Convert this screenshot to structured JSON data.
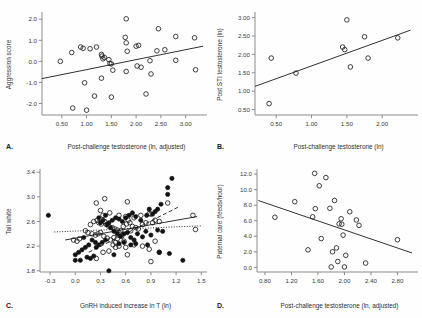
{
  "figure": {
    "name": "four-panel-scatter-figure",
    "panel_letters": {
      "a": "A.",
      "b": "B.",
      "c": "C.",
      "d": "D."
    }
  },
  "chart_data": [
    {
      "id": "a",
      "type": "scatter",
      "title": "",
      "xlabel": "Post-challenge testosterone (ln, adjusted)",
      "ylabel": "Aggression score",
      "xlim": [
        0.1,
        3.35
      ],
      "ylim": [
        -2.55,
        2.25
      ],
      "xticks": [
        0.5,
        1.0,
        1.5,
        2.0,
        2.5,
        3.0
      ],
      "xticklabels": [
        "0.50",
        "1.00",
        "1.50",
        "2.00",
        "2.50",
        "3.00"
      ],
      "yticks": [
        -2.0,
        -1.0,
        0.0,
        1.0,
        2.0
      ],
      "yticklabels": [
        "-2.0",
        "-1.0",
        "0.0",
        "1.0",
        "2.0"
      ],
      "grid": false,
      "legend": "none",
      "marker": "open-circle",
      "points": [
        [
          0.47,
          0.0
        ],
        [
          0.7,
          0.42
        ],
        [
          0.72,
          -2.22
        ],
        [
          0.88,
          0.68
        ],
        [
          0.93,
          0.62
        ],
        [
          0.96,
          -1.02
        ],
        [
          1.0,
          -2.32
        ],
        [
          1.07,
          0.6
        ],
        [
          1.2,
          0.68
        ],
        [
          1.16,
          -1.65
        ],
        [
          1.3,
          0.33
        ],
        [
          1.31,
          0.25
        ],
        [
          1.33,
          0.12
        ],
        [
          1.36,
          0.18
        ],
        [
          1.3,
          -0.8
        ],
        [
          1.45,
          0.08
        ],
        [
          1.47,
          -0.1
        ],
        [
          1.5,
          -0.12
        ],
        [
          1.5,
          -1.7
        ],
        [
          1.53,
          -0.42
        ],
        [
          1.8,
          2.02
        ],
        [
          1.78,
          1.14
        ],
        [
          1.8,
          0.88
        ],
        [
          1.82,
          0.48
        ],
        [
          1.8,
          -0.48
        ],
        [
          2.0,
          0.72
        ],
        [
          2.05,
          0.76
        ],
        [
          2.02,
          -0.22
        ],
        [
          2.1,
          -0.28
        ],
        [
          2.2,
          -1.55
        ],
        [
          2.28,
          0.03
        ],
        [
          2.3,
          -0.6
        ],
        [
          2.42,
          0.5
        ],
        [
          2.45,
          1.55
        ],
        [
          2.58,
          0.55
        ],
        [
          2.8,
          1.18
        ],
        [
          2.8,
          0.05
        ],
        [
          3.18,
          1.12
        ],
        [
          3.2,
          -0.4
        ]
      ],
      "fit_lines": [
        {
          "style": "solid",
          "x0": 0.1,
          "y0": -0.82,
          "x1": 3.35,
          "y1": 0.72
        }
      ]
    },
    {
      "id": "b",
      "type": "scatter",
      "title": "",
      "xlabel": "Post-challenge testosterone (ln)",
      "ylabel": "Post STI testosterone (ln)",
      "xlim": [
        0.2,
        2.45
      ],
      "ylim": [
        0.35,
        3.1
      ],
      "xticks": [
        0.5,
        1.0,
        1.5,
        2.0
      ],
      "xticklabels": [
        "0.50",
        "1.00",
        "1.50",
        "2.00"
      ],
      "yticks": [
        0.5,
        1.0,
        1.5,
        2.0,
        2.5,
        3.0
      ],
      "yticklabels": [
        "0.50",
        "1.00",
        "1.50",
        "2.00",
        "2.50",
        "3.00"
      ],
      "grid": false,
      "legend": "none",
      "marker": "open-circle",
      "points": [
        [
          0.4,
          0.66
        ],
        [
          0.43,
          1.9
        ],
        [
          0.78,
          1.49
        ],
        [
          1.44,
          2.2
        ],
        [
          1.47,
          2.13
        ],
        [
          1.5,
          2.94
        ],
        [
          1.55,
          1.66
        ],
        [
          1.75,
          2.48
        ],
        [
          1.8,
          1.9
        ],
        [
          2.22,
          2.45
        ]
      ],
      "fit_lines": [
        {
          "style": "solid",
          "x0": 0.2,
          "y0": 1.13,
          "x1": 2.4,
          "y1": 2.66
        }
      ]
    },
    {
      "id": "c",
      "type": "scatter",
      "title": "",
      "xlabel": "GnRH induced increase in T (ln)",
      "ylabel": "Tail white",
      "xlim": [
        -0.42,
        1.52
      ],
      "ylim": [
        1.78,
        3.42
      ],
      "xticks": [
        -0.3,
        0.0,
        0.3,
        0.6,
        0.9,
        1.2,
        1.5
      ],
      "xticklabels": [
        "-0.3",
        "0.0",
        "0.3",
        "0.6",
        "0.9",
        "1.2",
        "1.5"
      ],
      "yticks": [
        1.8,
        2.2,
        2.6,
        3.0,
        3.4
      ],
      "yticklabels": [
        "1.8",
        "2.2",
        "2.6",
        "3.0",
        "3.4"
      ],
      "grid": false,
      "legend": "none",
      "marker": "mixed-open-and-filled",
      "points_open": [
        [
          0.25,
          2.9
        ],
        [
          0.35,
          2.97
        ],
        [
          0.62,
          2.92
        ],
        [
          0.3,
          2.78
        ],
        [
          0.33,
          2.7
        ],
        [
          0.41,
          2.74
        ],
        [
          0.52,
          2.7
        ],
        [
          0.6,
          2.68
        ],
        [
          0.63,
          2.62
        ],
        [
          0.7,
          2.66
        ],
        [
          0.78,
          2.7
        ],
        [
          0.88,
          2.73
        ],
        [
          0.9,
          2.72
        ],
        [
          0.95,
          2.62
        ],
        [
          1.0,
          2.6
        ],
        [
          1.1,
          2.9
        ],
        [
          1.4,
          2.7
        ],
        [
          1.43,
          2.47
        ],
        [
          0.18,
          2.55
        ],
        [
          0.22,
          2.6
        ],
        [
          0.26,
          2.62
        ],
        [
          0.28,
          2.58
        ],
        [
          0.31,
          2.56
        ],
        [
          0.35,
          2.6
        ],
        [
          0.37,
          2.55
        ],
        [
          0.4,
          2.52
        ],
        [
          0.44,
          2.5
        ],
        [
          0.47,
          2.48
        ],
        [
          0.5,
          2.46
        ],
        [
          0.54,
          2.45
        ],
        [
          0.57,
          2.52
        ],
        [
          0.61,
          2.56
        ],
        [
          0.65,
          2.58
        ],
        [
          0.68,
          2.52
        ],
        [
          0.72,
          2.5
        ],
        [
          0.8,
          2.55
        ],
        [
          0.84,
          2.58
        ],
        [
          0.92,
          2.58
        ],
        [
          0.12,
          2.45
        ],
        [
          0.15,
          2.42
        ],
        [
          0.2,
          2.4
        ],
        [
          0.24,
          2.38
        ],
        [
          0.27,
          2.4
        ],
        [
          0.3,
          2.42
        ],
        [
          0.34,
          2.36
        ],
        [
          0.38,
          2.33
        ],
        [
          0.42,
          2.3
        ],
        [
          0.46,
          2.34
        ],
        [
          0.5,
          2.32
        ],
        [
          0.55,
          2.36
        ],
        [
          0.58,
          2.28
        ],
        [
          0.05,
          2.32
        ],
        [
          -0.02,
          2.3
        ],
        [
          0.02,
          2.28
        ],
        [
          0.45,
          2.22
        ],
        [
          0.48,
          2.18
        ],
        [
          0.52,
          2.2
        ],
        [
          0.4,
          2.12
        ],
        [
          0.33,
          2.1
        ],
        [
          0.25,
          2.0
        ],
        [
          0.6,
          2.18
        ],
        [
          0.7,
          2.22
        ],
        [
          0.8,
          2.2
        ],
        [
          0.62,
          2.06
        ],
        [
          0.88,
          2.15
        ],
        [
          0.9,
          1.95
        ],
        [
          1.0,
          2.1
        ],
        [
          0.95,
          2.28
        ],
        [
          0.48,
          2.26
        ],
        [
          0.52,
          2.42
        ],
        [
          0.66,
          2.45
        ],
        [
          0.75,
          2.48
        ]
      ],
      "points_filled": [
        [
          -0.32,
          2.7
        ],
        [
          1.15,
          3.3
        ],
        [
          1.1,
          3.15
        ],
        [
          1.1,
          3.04
        ],
        [
          1.02,
          2.88
        ],
        [
          0.98,
          2.8
        ],
        [
          0.95,
          2.76
        ],
        [
          0.92,
          2.72
        ],
        [
          0.88,
          2.8
        ],
        [
          0.85,
          2.7
        ],
        [
          0.78,
          2.62
        ],
        [
          0.72,
          2.68
        ],
        [
          0.68,
          2.74
        ],
        [
          0.64,
          2.7
        ],
        [
          0.6,
          2.66
        ],
        [
          0.56,
          2.6
        ],
        [
          0.52,
          2.64
        ],
        [
          0.48,
          2.66
        ],
        [
          0.44,
          2.62
        ],
        [
          0.4,
          2.58
        ],
        [
          0.36,
          2.7
        ],
        [
          0.33,
          2.62
        ],
        [
          0.3,
          2.58
        ],
        [
          0.28,
          2.66
        ],
        [
          0.38,
          2.55
        ],
        [
          0.42,
          2.5
        ],
        [
          0.46,
          2.44
        ],
        [
          0.5,
          2.4
        ],
        [
          0.54,
          2.36
        ],
        [
          0.58,
          2.4
        ],
        [
          0.62,
          2.42
        ],
        [
          0.66,
          2.34
        ],
        [
          0.7,
          2.3
        ],
        [
          0.74,
          2.4
        ],
        [
          0.8,
          2.35
        ],
        [
          0.84,
          2.44
        ],
        [
          0.9,
          2.38
        ],
        [
          0.98,
          2.46
        ],
        [
          0.36,
          2.3
        ],
        [
          0.32,
          2.26
        ],
        [
          0.28,
          2.22
        ],
        [
          0.24,
          2.26
        ],
        [
          0.2,
          2.3
        ],
        [
          0.16,
          2.22
        ],
        [
          0.12,
          2.18
        ],
        [
          0.08,
          2.14
        ],
        [
          0.04,
          2.1
        ],
        [
          0.0,
          2.06
        ],
        [
          0.14,
          2.02
        ],
        [
          0.18,
          2.0
        ],
        [
          0.22,
          2.04
        ],
        [
          0.06,
          1.97
        ],
        [
          0.0,
          1.97
        ],
        [
          0.4,
          1.8
        ],
        [
          0.46,
          2.06
        ],
        [
          0.52,
          2.24
        ],
        [
          0.58,
          2.26
        ],
        [
          0.66,
          2.22
        ],
        [
          0.72,
          2.24
        ],
        [
          0.86,
          2.22
        ],
        [
          1.0,
          2.1
        ],
        [
          1.04,
          2.44
        ],
        [
          1.12,
          2.08
        ],
        [
          1.28,
          1.97
        ],
        [
          0.1,
          2.34
        ],
        [
          0.25,
          2.18
        ]
      ],
      "fit_lines": [
        {
          "style": "solid",
          "x0": -0.12,
          "y0": 2.3,
          "x1": 1.45,
          "y1": 2.68
        },
        {
          "style": "dashed",
          "x0": 0.16,
          "y0": 2.1,
          "x1": 1.22,
          "y1": 2.83
        },
        {
          "style": "dotted",
          "x0": -0.25,
          "y0": 2.43,
          "x1": 1.5,
          "y1": 2.53
        }
      ]
    },
    {
      "id": "d",
      "type": "scatter",
      "title": "",
      "xlabel": "Post-challenge testosterone (ln, adjusted)",
      "ylabel": "Paternal care (feeds/hour)",
      "xlim": [
        0.68,
        3.05
      ],
      "ylim": [
        -0.6,
        12.4
      ],
      "xticks": [
        0.8,
        1.2,
        1.6,
        2.0,
        2.4,
        2.8
      ],
      "xticklabels": [
        "0.80",
        "1.20",
        "1.60",
        "2.00",
        "2.40",
        "2.80"
      ],
      "yticks": [
        0.0,
        2.0,
        4.0,
        6.0,
        8.0,
        10.0,
        12.0
      ],
      "yticklabels": [
        "0.0",
        "2.0",
        "4.0",
        "6.0",
        "8.0",
        "10.0",
        "12.0"
      ],
      "grid": false,
      "legend": "none",
      "marker": "open-circle",
      "points": [
        [
          0.95,
          6.45
        ],
        [
          1.25,
          8.45
        ],
        [
          1.45,
          2.25
        ],
        [
          1.52,
          6.5
        ],
        [
          1.55,
          12.1
        ],
        [
          1.56,
          7.55
        ],
        [
          1.62,
          10.5
        ],
        [
          1.65,
          3.7
        ],
        [
          1.72,
          11.55
        ],
        [
          1.78,
          7.6
        ],
        [
          1.8,
          0.05
        ],
        [
          1.82,
          2.0
        ],
        [
          1.85,
          8.6
        ],
        [
          1.88,
          2.5
        ],
        [
          1.9,
          0.75
        ],
        [
          1.92,
          5.6
        ],
        [
          1.95,
          6.25
        ],
        [
          1.96,
          5.55
        ],
        [
          1.98,
          4.15
        ],
        [
          2.0,
          0.05
        ],
        [
          2.02,
          1.55
        ],
        [
          2.08,
          7.15
        ],
        [
          2.18,
          6.1
        ],
        [
          2.22,
          5.4
        ],
        [
          2.32,
          0.55
        ],
        [
          2.8,
          3.55
        ]
      ],
      "fit_lines": [
        {
          "style": "solid",
          "x0": 0.7,
          "y0": 8.6,
          "x1": 3.02,
          "y1": 1.85
        }
      ]
    }
  ]
}
